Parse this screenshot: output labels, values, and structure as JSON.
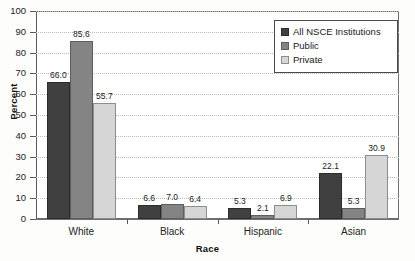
{
  "chart_data": {
    "type": "bar",
    "title": "",
    "xlabel": "Race",
    "ylabel": "Percent",
    "categories": [
      "White",
      "Black",
      "Hispanic",
      "Asian"
    ],
    "series": [
      {
        "name": "All NSCE Institutions",
        "color": "#404040",
        "values": [
          66.0,
          6.6,
          5.3,
          22.1
        ]
      },
      {
        "name": "Public",
        "color": "#848484",
        "values": [
          85.6,
          7.0,
          2.1,
          5.3
        ]
      },
      {
        "name": "Private",
        "color": "#d6d6d6",
        "values": [
          55.7,
          6.4,
          6.9,
          30.9
        ]
      }
    ],
    "value_labels": [
      [
        "66.0",
        "85.6",
        "55.7"
      ],
      [
        "6.6",
        "7.0",
        "6.4"
      ],
      [
        "5.3",
        "2.1",
        "6.9"
      ],
      [
        "22.1",
        "5.3",
        "30.9"
      ]
    ],
    "ylim": [
      0,
      100
    ],
    "yticks": [
      "0",
      "10",
      "20",
      "30",
      "40",
      "50",
      "60",
      "70",
      "80",
      "90",
      "100"
    ],
    "grid": true,
    "legend_position": "top-right"
  }
}
